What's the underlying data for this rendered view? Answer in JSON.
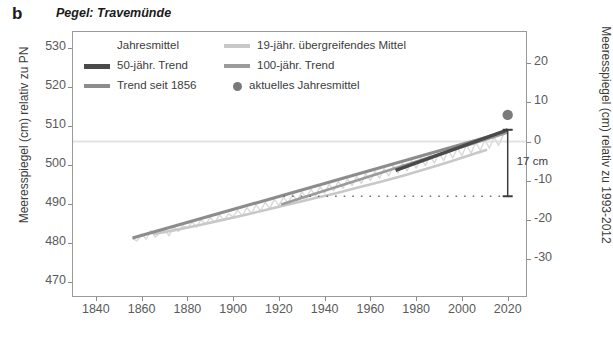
{
  "panel": {
    "label": "b",
    "title": "Pegel: Travemünde"
  },
  "axes": {
    "y_left_title": "Meeresspiegel (cm) relativ zu PN",
    "y_right_title": "Meeresspiegel (cm) relativ zu 1993-2012",
    "x_title": "",
    "y_left_ticks": [
      "530",
      "520",
      "510",
      "500",
      "490",
      "480",
      "470"
    ],
    "y_right_ticks": [
      "20",
      "10",
      "0",
      "-10",
      "-20",
      "-30"
    ],
    "x_ticks": [
      "1840",
      "1860",
      "1880",
      "1900",
      "1920",
      "1940",
      "1960",
      "1980",
      "2000",
      "2020"
    ]
  },
  "legend": {
    "rows": [
      {
        "left": {
          "swatch": "none",
          "label": "Jahresmittel"
        },
        "right": {
          "swatch": "line",
          "color": "#c8c8c8",
          "label": "19-jähr. übergreifendes Mittel"
        }
      },
      {
        "left": {
          "swatch": "line",
          "color": "#4a4a4a",
          "label": "50-jähr. Trend"
        },
        "right": {
          "swatch": "line",
          "color": "#9b9b9b",
          "label": "100-jähr. Trend"
        }
      },
      {
        "left": {
          "swatch": "line",
          "color": "#8c8c8c",
          "label": "Trend seit 1856"
        },
        "right": {
          "swatch": "dot",
          "color": "#7a7a7a",
          "label": "aktuelles Jahresmittel"
        }
      }
    ]
  },
  "annotations": {
    "bracket_label": "17 cm"
  },
  "colors": {
    "annual_mean": "#d9d9d9",
    "mean19": "#c8c8c8",
    "trend50": "#4a4a4a",
    "trend100": "#9b9b9b",
    "trend1856": "#8c8c8c",
    "current_dot": "#7a7a7a",
    "zero_line": "#e3e3e3",
    "dotted_ref": "#6f6f6f",
    "frame": "#9a9a9a",
    "text": "#3c3c3c"
  },
  "chart_data": {
    "type": "line",
    "title": "Pegel: Travemünde",
    "xlabel": "",
    "ylabel": "Meeresspiegel (cm) relativ zu PN",
    "ylabel_right": "Meeresspiegel (cm) relativ zu 1993-2012",
    "xlim": [
      1830,
      2028
    ],
    "ylim": [
      466.5,
      534
    ],
    "ylim_right": [
      -39.5,
      28
    ],
    "y_right_offset": 506,
    "grid": false,
    "legend_position": "top-inside",
    "xticks": [
      1840,
      1860,
      1880,
      1900,
      1920,
      1940,
      1960,
      1980,
      2000,
      2020
    ],
    "yticks": [
      470,
      480,
      490,
      500,
      510,
      520,
      530
    ],
    "yticks_right": [
      -30,
      -20,
      -10,
      0,
      10,
      20
    ],
    "reference_lines": [
      {
        "name": "zero-reference",
        "y": 506,
        "style": "solid",
        "color": "#e3e3e3"
      },
      {
        "name": "17cm-baseline",
        "y": 492,
        "x_from": 1922,
        "x_to": 2020,
        "style": "dotted",
        "color": "#6f6f6f"
      }
    ],
    "annotations": [
      {
        "name": "bracket-17cm",
        "text": "17 cm",
        "x": 2020,
        "y_from": 492,
        "y_to": 509
      }
    ],
    "series": [
      {
        "name": "Jahresmittel",
        "type": "line",
        "color": "#d9d9d9",
        "x": [
          1856,
          1858,
          1860,
          1862,
          1864,
          1866,
          1868,
          1870,
          1872,
          1874,
          1876,
          1878,
          1880,
          1882,
          1884,
          1886,
          1888,
          1890,
          1892,
          1894,
          1896,
          1898,
          1900,
          1902,
          1904,
          1906,
          1908,
          1910,
          1912,
          1914,
          1916,
          1918,
          1920,
          1922,
          1924,
          1926,
          1928,
          1930,
          1932,
          1934,
          1936,
          1938,
          1940,
          1942,
          1944,
          1946,
          1948,
          1950,
          1952,
          1954,
          1956,
          1958,
          1960,
          1962,
          1964,
          1966,
          1968,
          1970,
          1972,
          1974,
          1976,
          1978,
          1980,
          1982,
          1984,
          1986,
          1988,
          1990,
          1992,
          1994,
          1996,
          1998,
          2000,
          2002,
          2004,
          2006,
          2008,
          2010,
          2012,
          2014,
          2016,
          2018,
          2020
        ],
        "y": [
          481.2,
          480.6,
          482.4,
          481.0,
          483.2,
          481.5,
          482.8,
          483.6,
          481.9,
          484.2,
          483.0,
          484.5,
          483.8,
          485.4,
          484.1,
          486.0,
          484.8,
          486.6,
          485.3,
          487.2,
          485.9,
          487.5,
          486.8,
          488.4,
          487.0,
          489.1,
          487.6,
          489.8,
          488.3,
          490.4,
          488.9,
          491.2,
          489.6,
          491.8,
          490.2,
          492.5,
          490.9,
          493.2,
          491.5,
          493.8,
          492.1,
          494.5,
          492.8,
          495.1,
          493.4,
          495.8,
          494.0,
          496.4,
          494.7,
          497.1,
          495.3,
          497.8,
          496.0,
          498.4,
          496.6,
          499.1,
          497.2,
          499.8,
          497.9,
          500.4,
          498.5,
          501.1,
          499.2,
          501.8,
          499.8,
          502.4,
          500.5,
          503.1,
          501.1,
          503.8,
          501.8,
          504.4,
          502.4,
          505.1,
          503.0,
          505.8,
          503.7,
          506.4,
          504.3,
          507.1,
          505.0,
          507.7,
          508.9
        ]
      },
      {
        "name": "19-jähr. übergreifendes Mittel",
        "type": "line",
        "color": "#c8c8c8",
        "x": [
          1865,
          1875,
          1885,
          1895,
          1905,
          1915,
          1925,
          1935,
          1945,
          1955,
          1965,
          1975,
          1985,
          1995,
          2005,
          2011
        ],
        "y": [
          482.3,
          483.4,
          484.6,
          485.9,
          487.2,
          488.6,
          490.0,
          491.4,
          492.8,
          494.3,
          495.8,
          497.4,
          499.1,
          500.9,
          502.8,
          503.9
        ]
      },
      {
        "name": "100-jähr. Trend",
        "type": "trend",
        "color": "#9b9b9b",
        "x": [
          1921,
          2020
        ],
        "y": [
          489.9,
          508.3
        ]
      },
      {
        "name": "Trend seit 1856",
        "type": "trend",
        "color": "#8c8c8c",
        "x": [
          1856,
          2020
        ],
        "y": [
          481.3,
          508.6
        ]
      },
      {
        "name": "50-jähr. Trend",
        "type": "trend",
        "color": "#4a4a4a",
        "x": [
          1971,
          2020
        ],
        "y": [
          498.6,
          509.0
        ]
      }
    ],
    "points": [
      {
        "name": "aktuelles Jahresmittel",
        "x": 2020,
        "y": 512.8,
        "color": "#7a7a7a"
      }
    ]
  }
}
